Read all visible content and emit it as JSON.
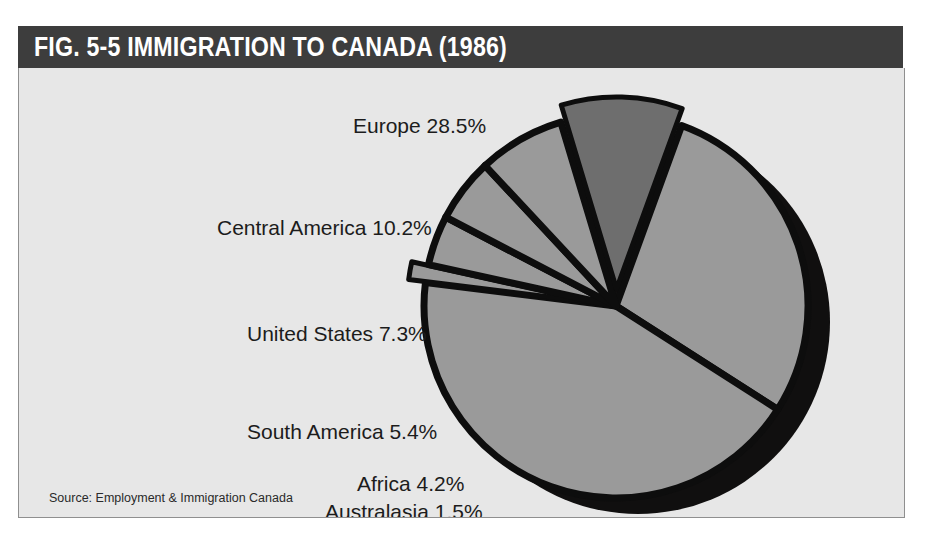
{
  "figure": {
    "title": "FIG. 5-5  IMMIGRATION TO CANADA (1986)",
    "source": "Source:  Employment & Immigration Canada"
  },
  "colors": {
    "header_bar": "#3d3d3d",
    "header_text": "#ffffff",
    "plot_background": "#e7e7e7",
    "plot_border": "#8f8f8f",
    "slice_light": "#9a9a9a",
    "slice_dark": "#6e6e6e",
    "separator": "#0d0d0d",
    "shadow": "#100f0f",
    "label_text": "#1c1c1c"
  },
  "chart_data": {
    "type": "pie",
    "title": "FIG. 5-5  IMMIGRATION TO CANADA (1986)",
    "xlabel": "",
    "ylabel": "",
    "legend_position": "none",
    "grid": false,
    "unit": "%",
    "source": "Source:  Employment & Immigration Canada",
    "categories": [
      "Asia",
      "Europe",
      "Central America",
      "United States",
      "South America",
      "Africa",
      "Australasia"
    ],
    "values": [
      42.9,
      28.5,
      10.2,
      7.3,
      5.4,
      4.2,
      1.5
    ],
    "slices": [
      {
        "label": "Europe 28.5%",
        "name": "Europe",
        "value": 28.5,
        "fill": "#9a9a9a",
        "exploded": false
      },
      {
        "label": "Asia 42.9%",
        "name": "Asia",
        "value": 42.9,
        "fill": "#9a9a9a",
        "exploded": false
      },
      {
        "label": "Australasia 1.5%",
        "name": "Australasia",
        "value": 1.5,
        "fill": "#9a9a9a",
        "exploded": true
      },
      {
        "label": "Africa 4.2%",
        "name": "Africa",
        "value": 4.2,
        "fill": "#9a9a9a",
        "exploded": false
      },
      {
        "label": "South America 5.4%",
        "name": "South America",
        "value": 5.4,
        "fill": "#9a9a9a",
        "exploded": false
      },
      {
        "label": "United States 7.3%",
        "name": "United States",
        "value": 7.3,
        "fill": "#9a9a9a",
        "exploded": false
      },
      {
        "label": "Central America 10.2%",
        "name": "Central America",
        "value": 10.2,
        "fill": "#6e6e6e",
        "exploded": true
      }
    ]
  },
  "labels": {
    "europe": "Europe 28.5%",
    "central_america": "Central America 10.2%",
    "united_states": "United States 7.3%",
    "south_america": "South America 5.4%",
    "africa": "Africa 4.2%",
    "australasia": "Australasia 1.5%",
    "asia": "Asia 42.9%"
  }
}
